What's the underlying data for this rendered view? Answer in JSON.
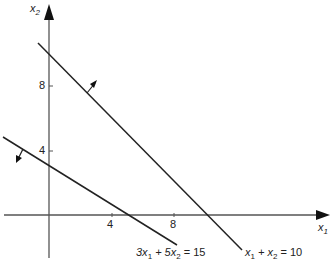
{
  "diagram": {
    "type": "linear-constraints-plot",
    "axes": {
      "x": {
        "label": "x",
        "subscript": "1",
        "ticks": [
          "4",
          "8"
        ]
      },
      "y": {
        "label": "x",
        "subscript": "2",
        "ticks": [
          "4",
          "8"
        ]
      }
    },
    "lines": [
      {
        "id": "line1",
        "equation": {
          "parts": [
            "x",
            "1",
            " + x",
            "2",
            " = 10"
          ]
        },
        "x_intercept": 10,
        "y_intercept": 10,
        "normal_arrow": "up-right"
      },
      {
        "id": "line2",
        "equation": {
          "parts": [
            "3x",
            "1",
            " + 5x",
            "2",
            " = 15"
          ]
        },
        "x_intercept": 5,
        "y_intercept": 3,
        "normal_arrow": "down-left"
      }
    ],
    "colors": {
      "line": "#222222",
      "axis": "#555555",
      "background": "#ffffff"
    }
  }
}
